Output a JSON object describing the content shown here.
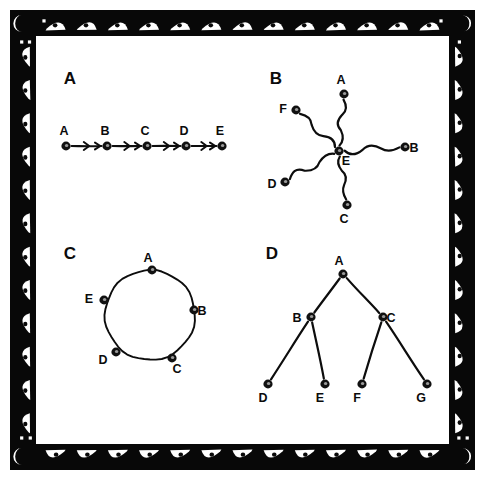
{
  "figure": {
    "background_color": "#ffffff",
    "ink_color": "#0b0b0b",
    "width": 485,
    "height": 480
  },
  "border": {
    "name": "decorative-tribal-border",
    "band_color": "#080808",
    "motif": "white-triangular-eye-wedge-with-dark-pupil",
    "motif_fill": "#ffffff",
    "pupil_fill": "#0a0a0a",
    "top_motif_count": 13,
    "bottom_motif_count": 13,
    "left_motif_count": 12,
    "right_motif_count": 12
  },
  "panels": [
    {
      "id": "panel-a",
      "label": "A",
      "topology": "linear-chain-directed",
      "label_x": 70,
      "label_y": 84,
      "nodes": [
        {
          "id": "A",
          "label": "A",
          "x": 66,
          "y": 146,
          "label_x": 64,
          "label_y": 135
        },
        {
          "id": "B",
          "label": "B",
          "x": 107,
          "y": 146,
          "label_x": 105,
          "label_y": 135
        },
        {
          "id": "C",
          "label": "C",
          "x": 147,
          "y": 146,
          "label_x": 145,
          "label_y": 135
        },
        {
          "id": "D",
          "label": "D",
          "x": 186,
          "y": 146,
          "label_x": 184,
          "label_y": 135
        },
        {
          "id": "E",
          "label": "E",
          "x": 222,
          "y": 146,
          "label_x": 220,
          "label_y": 135
        }
      ],
      "edges": [
        {
          "from": "A",
          "to": "B",
          "directed": true
        },
        {
          "from": "B",
          "to": "C",
          "directed": true
        },
        {
          "from": "C",
          "to": "D",
          "directed": true
        },
        {
          "from": "D",
          "to": "E",
          "directed": true
        }
      ]
    },
    {
      "id": "panel-b",
      "label": "B",
      "topology": "star-hub",
      "hub": "E",
      "label_x": 276,
      "label_y": 84,
      "nodes": [
        {
          "id": "A",
          "label": "A",
          "x": 344,
          "y": 94,
          "label_x": 341,
          "label_y": 84
        },
        {
          "id": "B",
          "label": "B",
          "x": 405,
          "y": 147,
          "label_x": 414,
          "label_y": 152
        },
        {
          "id": "C",
          "label": "C",
          "x": 347,
          "y": 205,
          "label_x": 344,
          "label_y": 223
        },
        {
          "id": "D",
          "label": "D",
          "x": 285,
          "y": 182,
          "label_x": 272,
          "label_y": 188
        },
        {
          "id": "E",
          "label": "E",
          "x": 339,
          "y": 151,
          "label_x": 346,
          "label_y": 165
        },
        {
          "id": "F",
          "label": "F",
          "x": 296,
          "y": 110,
          "label_x": 283,
          "label_y": 113
        }
      ],
      "edges": [
        {
          "from": "E",
          "to": "A",
          "directed": false
        },
        {
          "from": "E",
          "to": "B",
          "directed": false
        },
        {
          "from": "E",
          "to": "C",
          "directed": false
        },
        {
          "from": "E",
          "to": "D",
          "directed": false
        },
        {
          "from": "E",
          "to": "F",
          "directed": false
        }
      ]
    },
    {
      "id": "panel-c",
      "label": "C",
      "topology": "ring-cycle",
      "label_x": 70,
      "label_y": 259,
      "center_x": 150,
      "center_y": 315,
      "radius": 45,
      "nodes": [
        {
          "id": "A",
          "label": "A",
          "x": 152,
          "y": 270,
          "label_x": 148,
          "label_y": 262
        },
        {
          "id": "B",
          "label": "B",
          "x": 194,
          "y": 310,
          "label_x": 202,
          "label_y": 315
        },
        {
          "id": "C",
          "label": "C",
          "x": 172,
          "y": 358,
          "label_x": 177,
          "label_y": 373
        },
        {
          "id": "D",
          "label": "D",
          "x": 116,
          "y": 352,
          "label_x": 103,
          "label_y": 364
        },
        {
          "id": "E",
          "label": "E",
          "x": 104,
          "y": 300,
          "label_x": 89,
          "label_y": 303
        }
      ],
      "edges": [
        {
          "from": "A",
          "to": "B",
          "directed": false
        },
        {
          "from": "B",
          "to": "C",
          "directed": false
        },
        {
          "from": "C",
          "to": "D",
          "directed": false
        },
        {
          "from": "D",
          "to": "E",
          "directed": false
        },
        {
          "from": "E",
          "to": "A",
          "directed": false
        }
      ]
    },
    {
      "id": "panel-d",
      "label": "D",
      "topology": "binary-tree",
      "root": "A",
      "label_x": 272,
      "label_y": 259,
      "nodes": [
        {
          "id": "A",
          "label": "A",
          "x": 343,
          "y": 274,
          "label_x": 339,
          "label_y": 265
        },
        {
          "id": "B",
          "label": "B",
          "x": 311,
          "y": 317,
          "label_x": 297,
          "label_y": 322
        },
        {
          "id": "C",
          "label": "C",
          "x": 383,
          "y": 317,
          "label_x": 391,
          "label_y": 322
        },
        {
          "id": "D",
          "label": "D",
          "x": 268,
          "y": 384,
          "label_x": 263,
          "label_y": 402
        },
        {
          "id": "E",
          "label": "E",
          "x": 325,
          "y": 384,
          "label_x": 320,
          "label_y": 402
        },
        {
          "id": "F",
          "label": "F",
          "x": 362,
          "y": 384,
          "label_x": 357,
          "label_y": 402
        },
        {
          "id": "G",
          "label": "G",
          "x": 427,
          "y": 384,
          "label_x": 421,
          "label_y": 402
        }
      ],
      "edges": [
        {
          "from": "A",
          "to": "B",
          "directed": false
        },
        {
          "from": "A",
          "to": "C",
          "directed": false
        },
        {
          "from": "B",
          "to": "D",
          "directed": false
        },
        {
          "from": "B",
          "to": "E",
          "directed": false
        },
        {
          "from": "C",
          "to": "F",
          "directed": false
        },
        {
          "from": "C",
          "to": "G",
          "directed": false
        }
      ]
    }
  ]
}
